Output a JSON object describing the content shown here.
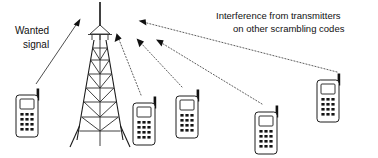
{
  "figure": {
    "type": "diagram",
    "background_color": "#ffffff",
    "line_color": "#1a1a1a",
    "text_color": "#111111",
    "width": 378,
    "height": 158
  },
  "labels": {
    "wanted_signal_line1": "Wanted",
    "wanted_signal_line2": "signal",
    "interference_line1": "Interference from transmitters",
    "interference_line2": "on other scrambling codes"
  },
  "elements": {
    "tower_name": "cellular-base-station-tower",
    "phones": [
      {
        "id": "phone-wanted",
        "x": 14,
        "y": 92,
        "role": "wanted-signal-source"
      },
      {
        "id": "phone-interferer-1",
        "x": 133,
        "y": 100,
        "role": "interferer"
      },
      {
        "id": "phone-interferer-2",
        "x": 175,
        "y": 93,
        "role": "interferer"
      },
      {
        "id": "phone-interferer-3",
        "x": 254,
        "y": 111,
        "role": "interferer"
      },
      {
        "id": "phone-interferer-4",
        "x": 315,
        "y": 79,
        "role": "interferer"
      }
    ],
    "rays": [
      {
        "id": "ray-wanted",
        "style": "solid",
        "from": "phone-wanted",
        "to": "tower"
      },
      {
        "id": "ray-interference-1",
        "style": "dotted",
        "from": "phone-interferer-1",
        "to": "tower"
      },
      {
        "id": "ray-interference-2",
        "style": "dotted",
        "from": "phone-interferer-2",
        "to": "tower"
      },
      {
        "id": "ray-interference-3",
        "style": "dotted",
        "from": "phone-interferer-3",
        "to": "tower"
      },
      {
        "id": "ray-interference-4",
        "style": "dotted",
        "from": "phone-interferer-4",
        "to": "tower"
      }
    ]
  }
}
